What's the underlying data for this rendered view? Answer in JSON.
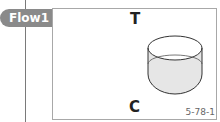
{
  "flow_tag": {
    "label": "Flow1"
  },
  "figure": {
    "top_label": "T",
    "bottom_label": "C",
    "figure_number": "5-78-1",
    "shape": "open-cylinder",
    "colors": {
      "stroke": "#333333",
      "fill": "#e6e6e6",
      "tag_bg": "#8a8a8a",
      "frame": "#a8a8a8"
    }
  }
}
